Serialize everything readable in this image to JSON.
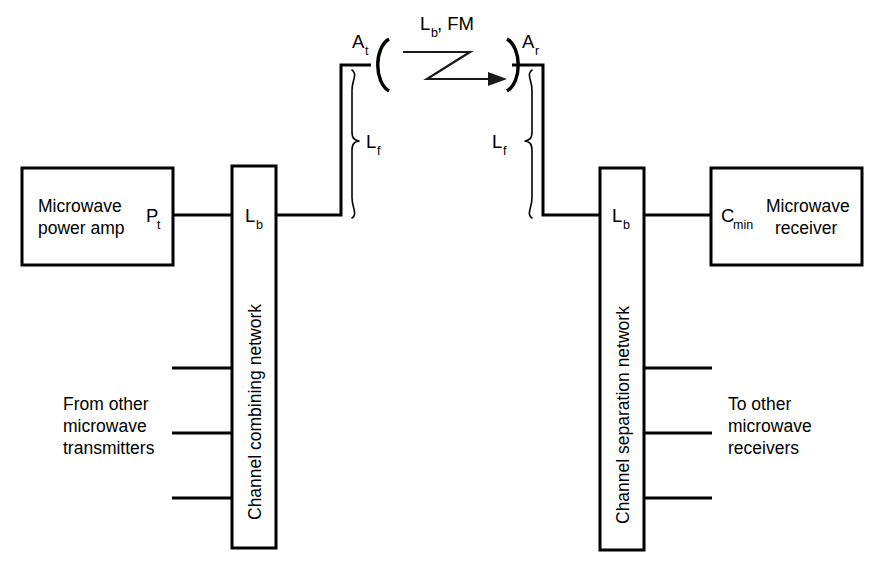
{
  "diagram": {
    "ink_color": "#000000",
    "background": "#ffffff",
    "transmit_side": {
      "amplifier_box": {
        "line1": "Microwave",
        "line2": "power amp",
        "output_symbol": "P",
        "output_subscript": "t"
      },
      "network_box": {
        "label": "Channel combining network",
        "loss_symbol": "L",
        "loss_subscript": "b"
      },
      "feeder": {
        "symbol": "L",
        "subscript": "f"
      },
      "antenna": {
        "symbol": "A",
        "subscript": "t"
      },
      "branch_note": {
        "line1": "From other",
        "line2": "microwave",
        "line3": "transmitters"
      }
    },
    "path": {
      "symbol": "L",
      "subscript": "b",
      "suffix": ", FM"
    },
    "receive_side": {
      "antenna": {
        "symbol": "A",
        "subscript": "r"
      },
      "feeder": {
        "symbol": "L",
        "subscript": "f"
      },
      "network_box": {
        "label": "Channel separation network",
        "loss_symbol": "L",
        "loss_subscript": "b"
      },
      "receiver_box": {
        "line1": "Microwave",
        "line2": "receiver",
        "input_symbol": "C",
        "input_subscript": "min"
      },
      "branch_note": {
        "line1": "To other",
        "line2": "microwave",
        "line3": "receivers"
      }
    }
  }
}
